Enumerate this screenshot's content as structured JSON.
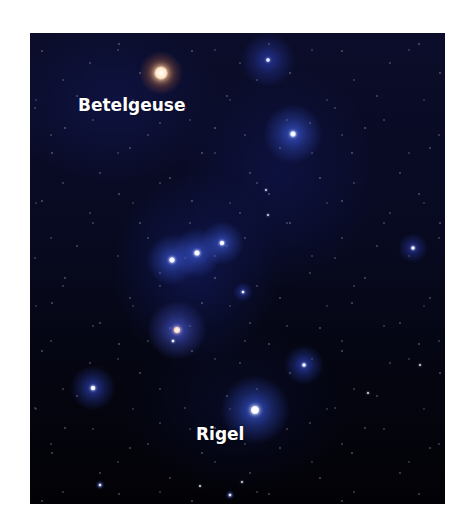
{
  "image": {
    "subject": "Orion constellation star field",
    "background_color": "#080a22",
    "labels": [
      {
        "text": "Betelgeuse",
        "x": 78,
        "y": 95
      },
      {
        "text": "Rigel",
        "x": 196,
        "y": 424
      }
    ],
    "stars": [
      {
        "name": "betelgeuse",
        "x": 161,
        "y": 73,
        "size": 14,
        "color": "#ffe8c8",
        "glow": "#d4703a",
        "glow_size": 44
      },
      {
        "name": "bellatrix",
        "x": 293,
        "y": 134,
        "size": 6,
        "color": "#eef2ff",
        "glow": "#3a58d8",
        "glow_size": 60
      },
      {
        "name": "meissa-cluster",
        "x": 268,
        "y": 60,
        "size": 4,
        "color": "#e0e8ff",
        "glow": "#2a3aa8",
        "glow_size": 55
      },
      {
        "name": "alnitak",
        "x": 172,
        "y": 260,
        "size": 6,
        "color": "#f0f4ff",
        "glow": "#3a55d0",
        "glow_size": 52
      },
      {
        "name": "alnilam",
        "x": 197,
        "y": 253,
        "size": 6,
        "color": "#f0f4ff",
        "glow": "#3a55d0",
        "glow_size": 50
      },
      {
        "name": "mintaka",
        "x": 222,
        "y": 243,
        "size": 5,
        "color": "#f0f4ff",
        "glow": "#3a55d0",
        "glow_size": 44
      },
      {
        "name": "orion-nebula",
        "x": 177,
        "y": 330,
        "size": 7,
        "color": "#ffd8c8",
        "glow": "#4a5ad8",
        "glow_size": 60
      },
      {
        "name": "nebula-companion",
        "x": 173,
        "y": 341,
        "size": 3,
        "color": "#e8ecff",
        "glow": "#3a55d0",
        "glow_size": 0
      },
      {
        "name": "saiph",
        "x": 93,
        "y": 388,
        "size": 5,
        "color": "#f0f4ff",
        "glow": "#2f45c0",
        "glow_size": 46
      },
      {
        "name": "rigel",
        "x": 255,
        "y": 410,
        "size": 9,
        "color": "#ffffff",
        "glow": "#3a5ae0",
        "glow_size": 70
      },
      {
        "name": "eta-orionis",
        "x": 304,
        "y": 365,
        "size": 4,
        "color": "#e8ecff",
        "glow": "#2f45c0",
        "glow_size": 40
      },
      {
        "name": "east-star",
        "x": 413,
        "y": 248,
        "size": 4,
        "color": "#e8ecff",
        "glow": "#2a3aa8",
        "glow_size": 30
      },
      {
        "name": "sword-star",
        "x": 243,
        "y": 292,
        "size": 3,
        "color": "#e8ecff",
        "glow": "#2a3aa8",
        "glow_size": 20
      },
      {
        "name": "star-a",
        "x": 266,
        "y": 190,
        "size": 2,
        "color": "#dfe6ff",
        "glow": "",
        "glow_size": 0
      },
      {
        "name": "star-b",
        "x": 268,
        "y": 215,
        "size": 2,
        "color": "#dfe6ff",
        "glow": "",
        "glow_size": 0
      },
      {
        "name": "star-c",
        "x": 100,
        "y": 485,
        "size": 3,
        "color": "#dfe6ff",
        "glow": "#2a3aa8",
        "glow_size": 10
      },
      {
        "name": "star-d",
        "x": 230,
        "y": 495,
        "size": 3,
        "color": "#dfe6ff",
        "glow": "#2a3aa8",
        "glow_size": 10
      },
      {
        "name": "star-e",
        "x": 200,
        "y": 486,
        "size": 2,
        "color": "#dfe6ff",
        "glow": "",
        "glow_size": 0
      },
      {
        "name": "star-f",
        "x": 242,
        "y": 482,
        "size": 2,
        "color": "#dfe6ff",
        "glow": "",
        "glow_size": 0
      },
      {
        "name": "star-g",
        "x": 420,
        "y": 365,
        "size": 2,
        "color": "#dfe6ff",
        "glow": "",
        "glow_size": 0
      },
      {
        "name": "star-h",
        "x": 368,
        "y": 393,
        "size": 2,
        "color": "#dfe6ff",
        "glow": "",
        "glow_size": 0
      }
    ]
  }
}
